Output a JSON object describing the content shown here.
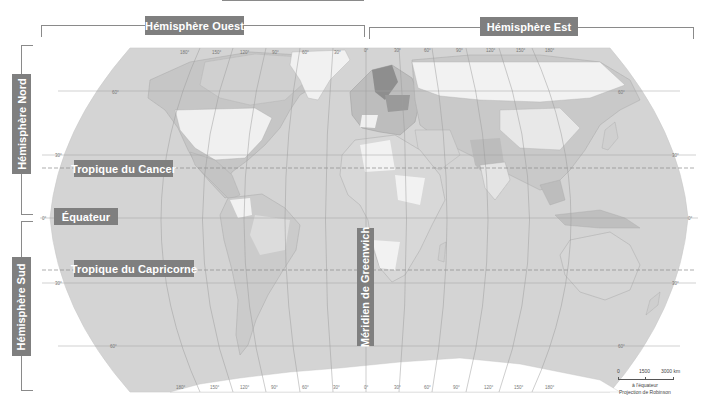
{
  "title_bar": {
    "visible_top_rule": true
  },
  "hemispheres": {
    "west": "Hémisphère Ouest",
    "east": "Hémisphère Est",
    "north": "Hémisphère Nord",
    "south": "Hémisphère Sud"
  },
  "lines": {
    "cancer": "Tropique du Cancer",
    "equator": "Équateur",
    "capricorn": "Tropique du Capricorne",
    "greenwich": "Méridien de Greenwich"
  },
  "longitude_ticks_top": [
    "180°",
    "150°",
    "120°",
    "90°",
    "60°",
    "30°",
    "0°",
    "30°",
    "60°",
    "90°",
    "120°",
    "150°",
    "180°"
  ],
  "longitude_ticks_bottom": [
    "180°",
    "150°",
    "120°",
    "90°",
    "60°",
    "30°",
    "0°",
    "30°",
    "60°",
    "90°",
    "120°",
    "150°",
    "180°"
  ],
  "latitude_ticks_left": [
    "60°",
    "30°",
    "0°",
    "30°",
    "60°"
  ],
  "latitude_ticks_right": [
    "60°",
    "30°",
    "0°",
    "30°",
    "60°"
  ],
  "scale": {
    "ticks": [
      "0",
      "1500",
      "3000 km"
    ],
    "note": "à l'équateur",
    "projection": "Projection de Robinson"
  },
  "colors": {
    "ocean": "#d4d4d4",
    "land_light": "#f2f2f2",
    "land_mid": "#c2c2c2",
    "land_dark": "#9a9a9a",
    "label_bg": "#7f7f7f",
    "grid": "#a8a8a8"
  }
}
